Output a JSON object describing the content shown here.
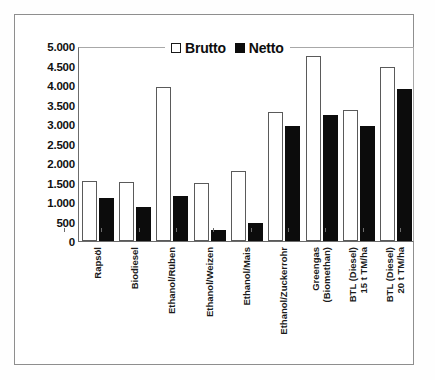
{
  "chart_data": {
    "type": "bar",
    "title": "",
    "xlabel": "",
    "ylabel": "",
    "ylim": [
      0,
      5000
    ],
    "grid": false,
    "legend_position": "top-center",
    "y_ticks": [
      "0",
      "500",
      "1.000",
      "1.500",
      "2.000",
      "2.500",
      "3.000",
      "3.500",
      "4.000",
      "4.500",
      "5.000"
    ],
    "y_tick_values": [
      0,
      500,
      1000,
      1500,
      2000,
      2500,
      3000,
      3500,
      4000,
      4500,
      5000
    ],
    "categories": [
      "Rapsöl",
      "Biodiesel",
      "Ethanol/Rüben",
      "Ethanol/Weizen",
      "Ethanol/Mais",
      "Ethanol/Zuckerrohr",
      "Greengas (Biomethan)",
      "BTL (Diesel) 15 t TM/ha",
      "BTL (Diesel) 20 t TM/ha"
    ],
    "category_lines": [
      [
        "Rapsöl"
      ],
      [
        "Biodiesel"
      ],
      [
        "Ethanol/Rüben"
      ],
      [
        "Ethanol/Weizen"
      ],
      [
        "Ethanol/Mais"
      ],
      [
        "Ethanol/Zuckerrohr"
      ],
      [
        "Greengas",
        "(Biomethan)"
      ],
      [
        "BTL (Diesel)",
        "15 t TM/ha"
      ],
      [
        "BTL (Diesel)",
        "20 t TM/ha"
      ]
    ],
    "series": [
      {
        "name": "Brutto",
        "color": "#ffffff",
        "edge_color": "#5a5a5a",
        "values": [
          1550,
          1520,
          3950,
          1490,
          1790,
          3300,
          4740,
          3360,
          4450
        ]
      },
      {
        "name": "Netto",
        "color": "#0c0c0c",
        "edge_color": "#0c0c0c",
        "values": [
          1100,
          860,
          1160,
          280,
          460,
          2940,
          3220,
          2940,
          3890
        ]
      }
    ]
  },
  "legend": {
    "entries": [
      {
        "label": "Brutto",
        "swatch": "open-square-icon"
      },
      {
        "label": "Netto",
        "swatch": "filled-square-icon"
      }
    ]
  }
}
